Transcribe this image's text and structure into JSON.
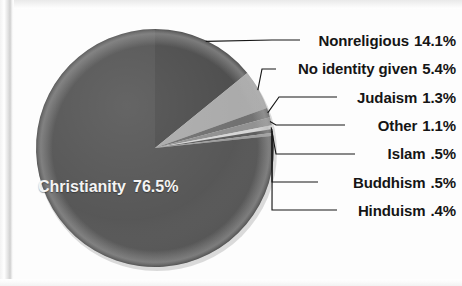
{
  "figure": {
    "background_color": "#fdfdfd",
    "label_color": "#151515",
    "inner_label_color": "#f4f4f4",
    "leader_line_color": "#161616"
  },
  "chart_data": {
    "type": "pie",
    "title": "",
    "subtitle": "",
    "xlabel": "",
    "ylabel": "",
    "legend_position": "none",
    "grid": false,
    "label_format": "name value",
    "start_angle_deg": 0,
    "direction": "clockwise",
    "categories": [
      "Nonreligious",
      "No identity given",
      "Judaism",
      "Other",
      "Islam",
      "Buddhism",
      "Hinduism",
      "Christianity"
    ],
    "values": [
      14.1,
      5.4,
      1.3,
      1.1,
      0.5,
      0.5,
      0.4,
      76.5
    ],
    "value_labels": [
      "14.1%",
      "5.4%",
      "1.3%",
      "1.1%",
      ".5%",
      ".5%",
      ".4%",
      "76.5%"
    ],
    "colors": [
      "#4b4b4b",
      "#a9a9a9",
      "#6e6e6e",
      "#8f8f8f",
      "#d6d6d6",
      "#5a5a5a",
      "#9b9b9b",
      "#545454"
    ],
    "slices": [
      {
        "name": "Nonreligious",
        "label": "Nonreligious",
        "value": 14.1,
        "value_label": "14.1%",
        "color": "#4b4b4b",
        "callout": true
      },
      {
        "name": "No identity given",
        "label": "No identity given",
        "value": 5.4,
        "value_label": "5.4%",
        "color": "#a9a9a9",
        "callout": true
      },
      {
        "name": "Judaism",
        "label": "Judaism",
        "value": 1.3,
        "value_label": "1.3%",
        "color": "#6e6e6e",
        "callout": true
      },
      {
        "name": "Other",
        "label": "Other",
        "value": 1.1,
        "value_label": "1.1%",
        "color": "#8f8f8f",
        "callout": true
      },
      {
        "name": "Islam",
        "label": "Islam",
        "value": 0.5,
        "value_label": ".5%",
        "color": "#d6d6d6",
        "callout": true
      },
      {
        "name": "Buddhism",
        "label": "Buddhism",
        "value": 0.5,
        "value_label": ".5%",
        "color": "#5a5a5a",
        "callout": true
      },
      {
        "name": "Hinduism",
        "label": "Hinduism",
        "value": 0.4,
        "value_label": ".4%",
        "color": "#9b9b9b",
        "callout": true
      },
      {
        "name": "Christianity",
        "label": "Christianity",
        "value": 76.5,
        "value_label": "76.5%",
        "color": "#545454",
        "callout": false
      }
    ]
  }
}
